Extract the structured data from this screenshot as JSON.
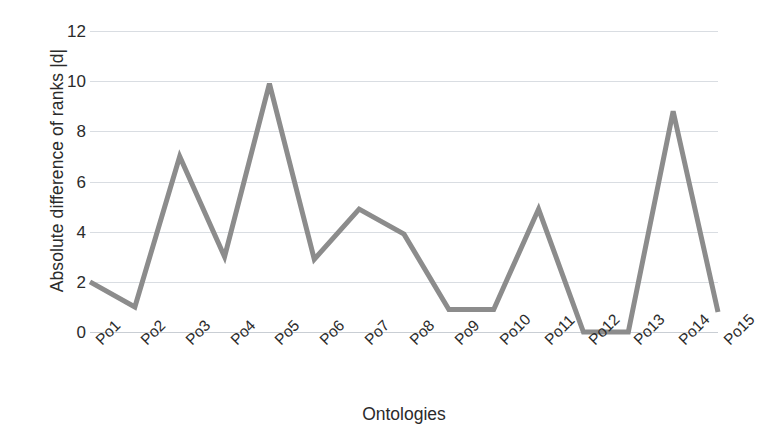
{
  "chart_data": {
    "type": "line",
    "title": "",
    "xlabel": "Ontologies",
    "ylabel": "Absolute difference of ranks |d|",
    "categories": [
      "Po1",
      "Po2",
      "Po3",
      "Po4",
      "Po5",
      "Po6",
      "Po7",
      "Po8",
      "Po9",
      "Po10",
      "Po11",
      "Po12",
      "Po13",
      "Po14",
      "Po15"
    ],
    "values": [
      2,
      1,
      7,
      3,
      9.9,
      2.9,
      4.9,
      3.9,
      0.9,
      0.9,
      4.9,
      0,
      0,
      8.8,
      0.8
    ],
    "series": [
      {
        "name": "Absolute difference of ranks |d|",
        "values": [
          2,
          1,
          7,
          3,
          9.9,
          2.9,
          4.9,
          3.9,
          0.9,
          0.9,
          4.9,
          0,
          0,
          8.8,
          0.8
        ],
        "color": "#8c8c8c"
      }
    ],
    "ylim": [
      0,
      12
    ],
    "yticks": [
      0,
      2,
      4,
      6,
      8,
      10,
      12
    ],
    "ytick_labels": [
      "0",
      "2",
      "4",
      "6",
      "8",
      "10",
      "12"
    ],
    "grid": true,
    "grid_axis": "y",
    "legend": false,
    "legend_position": "none",
    "line_color": "#8c8c8c",
    "line_width": 5,
    "markers": false,
    "background_color": "#ffffff",
    "gridline_color": "#d9dde2",
    "text_color": "#2b2b2b",
    "xtick_rotation": -45
  }
}
